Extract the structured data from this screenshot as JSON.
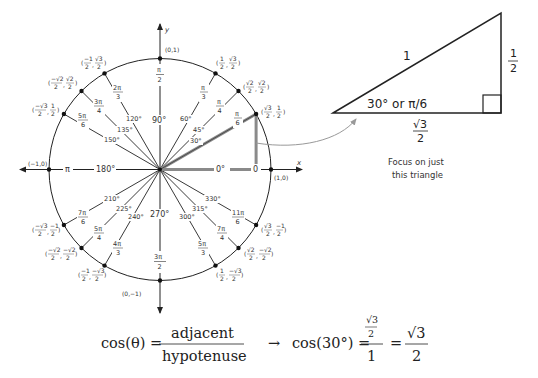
{
  "unit_circle": {
    "axes": {
      "x_label": "x",
      "y_label": "y"
    },
    "axis_points": {
      "top": "(0,1)",
      "bottom": "(0,−1)",
      "left": "(−1,0)",
      "right": "(1,0)"
    },
    "axis_angles": {
      "deg_0": "0°",
      "rad_0": "0",
      "deg_90": "90°",
      "rad_90_num": "π",
      "rad_90_den": "2",
      "deg_180": "180°",
      "rad_180": "π",
      "deg_270": "270°",
      "rad_270_num": "3π",
      "rad_270_den": "2"
    },
    "angles": [
      {
        "deg": "30°",
        "rad_num": "π",
        "rad_den": "6",
        "x_num": "√3",
        "x_den": "2",
        "y_num": "1",
        "y_den": "2"
      },
      {
        "deg": "45°",
        "rad_num": "π",
        "rad_den": "4",
        "x_num": "√2",
        "x_den": "2",
        "y_num": "√2",
        "y_den": "2"
      },
      {
        "deg": "60°",
        "rad_num": "π",
        "rad_den": "3",
        "x_num": "1",
        "x_den": "2",
        "y_num": "√3",
        "y_den": "2"
      },
      {
        "deg": "120°",
        "rad_num": "2π",
        "rad_den": "3",
        "x_num": "−1",
        "x_den": "2",
        "y_num": "√3",
        "y_den": "2"
      },
      {
        "deg": "135°",
        "rad_num": "3π",
        "rad_den": "4",
        "x_num": "−√2",
        "x_den": "2",
        "y_num": "√2",
        "y_den": "2"
      },
      {
        "deg": "150°",
        "rad_num": "5π",
        "rad_den": "6",
        "x_num": "−√3",
        "x_den": "2",
        "y_num": "1",
        "y_den": "2"
      },
      {
        "deg": "210°",
        "rad_num": "7π",
        "rad_den": "6",
        "x_num": "−√3",
        "x_den": "2",
        "y_num": "−1",
        "y_den": "2"
      },
      {
        "deg": "225°",
        "rad_num": "5π",
        "rad_den": "4",
        "x_num": "−√2",
        "x_den": "2",
        "y_num": "−√2",
        "y_den": "2"
      },
      {
        "deg": "240°",
        "rad_num": "4π",
        "rad_den": "3",
        "x_num": "−1",
        "x_den": "2",
        "y_num": "−√3",
        "y_den": "2"
      },
      {
        "deg": "300°",
        "rad_num": "5π",
        "rad_den": "3",
        "x_num": "1",
        "x_den": "2",
        "y_num": "−√3",
        "y_den": "2"
      },
      {
        "deg": "315°",
        "rad_num": "7π",
        "rad_den": "4",
        "x_num": "√2",
        "x_den": "2",
        "y_num": "−√2",
        "y_den": "2"
      },
      {
        "deg": "330°",
        "rad_num": "11π",
        "rad_den": "6",
        "x_num": "√3",
        "x_den": "2",
        "y_num": "−1",
        "y_den": "2"
      }
    ]
  },
  "triangle": {
    "hypotenuse": "1",
    "opposite_num": "1",
    "opposite_den": "2",
    "adjacent_num": "√3",
    "adjacent_den": "2",
    "angle_label": "30° or π/6",
    "caption_line1": "Focus on just",
    "caption_line2": "this triangle"
  },
  "equation": {
    "lhs": "cos(θ) =",
    "def_num": "adjacent",
    "def_den": "hypotenuse",
    "arrow": "→",
    "apply": "cos(30°) =",
    "inner_num": "√3",
    "inner_den": "2",
    "outer_den": "1",
    "equals": "=",
    "result_num": "√3",
    "result_den": "2"
  },
  "colors": {
    "line": "#222222",
    "highlight": "#8a8a8a",
    "arrow": "#9a9a9a"
  }
}
